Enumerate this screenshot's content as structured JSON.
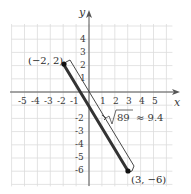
{
  "diagram": {
    "type": "coordinate-plane",
    "axes": {
      "x_label": "x",
      "y_label": "y",
      "x_ticks": [
        "-5",
        "-4",
        "-3",
        "-2",
        "-1",
        "1",
        "2",
        "3",
        "4",
        "5"
      ],
      "y_ticks_positive": [
        "4",
        "3",
        "2",
        "1"
      ],
      "y_ticks_negative": [
        "-2",
        "-3",
        "-4",
        "-5",
        "-6"
      ],
      "x_tick_values": [
        -5,
        -4,
        -3,
        -2,
        -1,
        1,
        2,
        3,
        4,
        5
      ],
      "y_tick_values": [
        4,
        3,
        2,
        1,
        -2,
        -3,
        -4,
        -5,
        -6
      ]
    },
    "grid": {
      "x_min": -6,
      "x_max": 6,
      "y_min": -7,
      "y_max": 5
    },
    "points": [
      {
        "label": "(−2, 2)",
        "x": -2,
        "y": 2
      },
      {
        "label": "(3, −6)",
        "x": 3,
        "y": -6
      }
    ],
    "segment": {
      "from": [
        -2,
        2
      ],
      "to": [
        3,
        -6
      ]
    },
    "distance_label": {
      "radical": "89",
      "approx": "≈ 9.4",
      "full": "√89 ≈ 9.4"
    },
    "colors": {
      "grid": "#d8d8d8",
      "axis": "#555555",
      "segment": "#333333",
      "text": "#333333"
    }
  }
}
